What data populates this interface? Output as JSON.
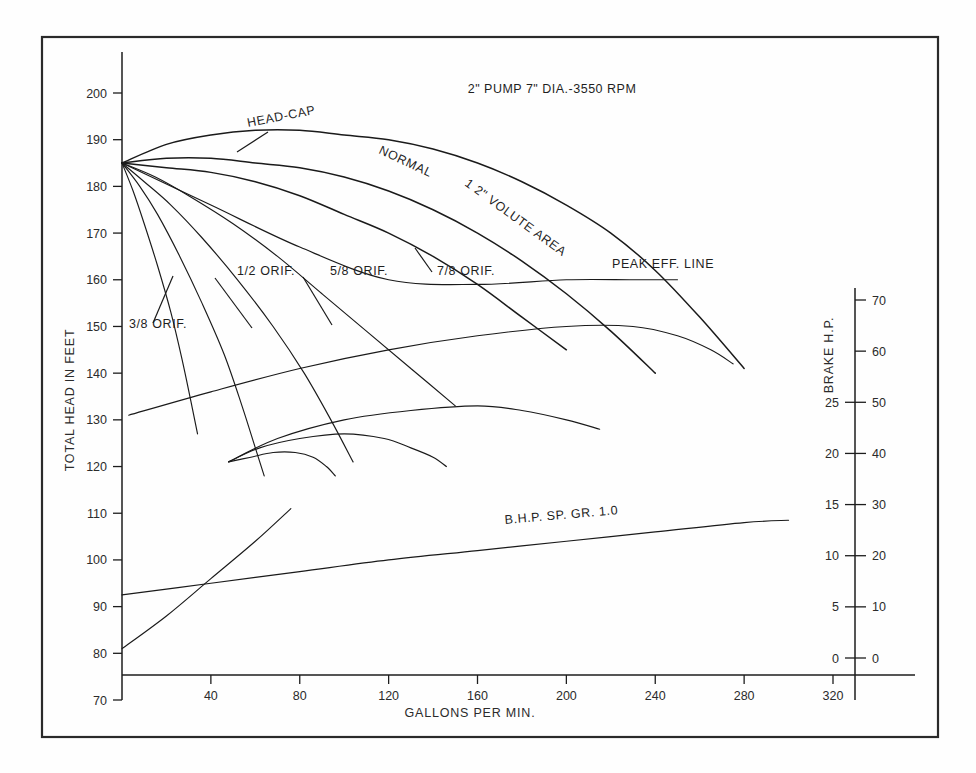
{
  "chart_data": {
    "type": "line",
    "title": "2\" PUMP 7\" DIA.-3550 RPM",
    "xlabel": "GALLONS PER MIN.",
    "ylabel": "TOTAL HEAD IN FEET",
    "y2label": "BRAKE H.P.",
    "xlim": [
      0,
      340
    ],
    "ylim": [
      70,
      205
    ],
    "grid": false,
    "legend_position": "inline-annotations",
    "xticks": [
      40,
      80,
      120,
      160,
      200,
      240,
      280,
      320
    ],
    "yticks": [
      70,
      80,
      90,
      100,
      110,
      120,
      130,
      140,
      150,
      160,
      170,
      180,
      190,
      200
    ],
    "y2_ticks_outer": [
      0,
      10,
      20,
      30,
      40,
      50,
      60,
      70
    ],
    "y2_ticks_inner": [
      0,
      5,
      10,
      15,
      20,
      25
    ],
    "shutoff_head": 185,
    "annotations": [
      {
        "id": "head-cap",
        "label": "HEAD-CAP",
        "rotation": -11
      },
      {
        "id": "normal",
        "label": "NORMAL",
        "rotation": 25
      },
      {
        "id": "volute-area",
        "label": "1 2\" VOLUTE AREA",
        "rotation": 36
      },
      {
        "id": "peak-eff-line",
        "label": "PEAK EFF. LINE",
        "rotation": 0
      },
      {
        "id": "orif-38",
        "label": "3/8 ORIF.",
        "rotation": 0
      },
      {
        "id": "orif-12",
        "label": "1/2 ORIF.",
        "rotation": 0
      },
      {
        "id": "orif-58",
        "label": "5/8 ORIF.",
        "rotation": 0
      },
      {
        "id": "orif-78",
        "label": "7/8 ORIF.",
        "rotation": 0
      },
      {
        "id": "bhp-line",
        "label": "B.H.P. SP. GR. 1.0",
        "rotation": -5
      }
    ],
    "series": [
      {
        "name": "HEAD-CAP",
        "kind": "head-capacity",
        "points": [
          [
            0,
            185
          ],
          [
            20,
            189
          ],
          [
            40,
            191
          ],
          [
            60,
            192
          ],
          [
            80,
            192
          ],
          [
            100,
            191
          ],
          [
            120,
            190
          ],
          [
            140,
            188
          ],
          [
            160,
            185
          ],
          [
            180,
            181
          ],
          [
            200,
            176
          ],
          [
            220,
            170
          ],
          [
            240,
            162
          ],
          [
            260,
            152
          ],
          [
            280,
            141
          ]
        ]
      },
      {
        "name": "NORMAL",
        "kind": "head-capacity",
        "points": [
          [
            0,
            185
          ],
          [
            20,
            186
          ],
          [
            40,
            186
          ],
          [
            60,
            185
          ],
          [
            80,
            184
          ],
          [
            100,
            182
          ],
          [
            120,
            179
          ],
          [
            140,
            175
          ],
          [
            160,
            170
          ],
          [
            180,
            164
          ],
          [
            200,
            157
          ],
          [
            220,
            149
          ],
          [
            240,
            140
          ]
        ]
      },
      {
        "name": "1 2\" VOLUTE AREA",
        "kind": "head-capacity",
        "points": [
          [
            0,
            185
          ],
          [
            20,
            184
          ],
          [
            40,
            183
          ],
          [
            60,
            181
          ],
          [
            80,
            178
          ],
          [
            100,
            174
          ],
          [
            120,
            170
          ],
          [
            140,
            165
          ],
          [
            160,
            159
          ],
          [
            180,
            152
          ],
          [
            200,
            145
          ]
        ]
      },
      {
        "name": "7/8 ORIF.",
        "kind": "orifice",
        "points": [
          [
            0,
            185
          ],
          [
            15,
            182
          ],
          [
            30,
            178
          ],
          [
            50,
            172
          ],
          [
            70,
            165
          ],
          [
            90,
            157
          ],
          [
            110,
            149
          ],
          [
            130,
            141
          ],
          [
            150,
            133
          ]
        ]
      },
      {
        "name": "5/8 ORIF.",
        "kind": "orifice",
        "points": [
          [
            0,
            185
          ],
          [
            10,
            181
          ],
          [
            22,
            176
          ],
          [
            36,
            169
          ],
          [
            52,
            160
          ],
          [
            68,
            150
          ],
          [
            82,
            140
          ],
          [
            94,
            130
          ],
          [
            104,
            121
          ]
        ]
      },
      {
        "name": "1/2 ORIF.",
        "kind": "orifice",
        "points": [
          [
            0,
            185
          ],
          [
            8,
            180
          ],
          [
            16,
            174
          ],
          [
            26,
            165
          ],
          [
            36,
            155
          ],
          [
            46,
            144
          ],
          [
            54,
            133
          ],
          [
            60,
            124
          ],
          [
            64,
            118
          ]
        ]
      },
      {
        "name": "3/8 ORIF.",
        "kind": "orifice",
        "points": [
          [
            0,
            185
          ],
          [
            5,
            179
          ],
          [
            10,
            172
          ],
          [
            16,
            163
          ],
          [
            22,
            153
          ],
          [
            27,
            143
          ],
          [
            31,
            134
          ],
          [
            34,
            127
          ]
        ]
      },
      {
        "name": "PEAK EFF. LINE",
        "kind": "peak-efficiency",
        "points": [
          [
            0,
            185
          ],
          [
            40,
            176
          ],
          [
            80,
            167
          ],
          [
            120,
            160
          ],
          [
            160,
            159
          ],
          [
            200,
            160
          ],
          [
            230,
            160
          ],
          [
            250,
            160
          ]
        ]
      },
      {
        "name": "EFFICIENCY TOP",
        "kind": "efficiency",
        "points": [
          [
            3,
            131
          ],
          [
            40,
            136
          ],
          [
            80,
            141
          ],
          [
            120,
            145
          ],
          [
            160,
            148
          ],
          [
            200,
            150
          ],
          [
            230,
            150
          ],
          [
            250,
            148
          ],
          [
            265,
            145
          ],
          [
            275,
            142
          ]
        ]
      },
      {
        "name": "EFFICIENCY MID",
        "kind": "efficiency",
        "points": [
          [
            48,
            121
          ],
          [
            70,
            126
          ],
          [
            100,
            130
          ],
          [
            130,
            132
          ],
          [
            160,
            133
          ],
          [
            180,
            132
          ],
          [
            200,
            130
          ],
          [
            215,
            128
          ]
        ]
      },
      {
        "name": "EFFICIENCY LOW",
        "kind": "efficiency",
        "points": [
          [
            48,
            121
          ],
          [
            62,
            124
          ],
          [
            80,
            126
          ],
          [
            100,
            127
          ],
          [
            118,
            126
          ],
          [
            130,
            124
          ],
          [
            140,
            122
          ],
          [
            146,
            120
          ]
        ]
      },
      {
        "name": "EFFICIENCY SMALL",
        "kind": "efficiency",
        "points": [
          [
            48,
            121
          ],
          [
            58,
            122
          ],
          [
            68,
            123
          ],
          [
            78,
            123
          ],
          [
            86,
            122
          ],
          [
            92,
            120
          ],
          [
            96,
            118
          ]
        ]
      },
      {
        "name": "B.H.P. SP. GR. 1.0",
        "kind": "brake-horsepower",
        "points": [
          [
            0,
            92.5
          ],
          [
            40,
            95
          ],
          [
            80,
            97.5
          ],
          [
            120,
            100
          ],
          [
            160,
            102
          ],
          [
            200,
            104
          ],
          [
            240,
            106
          ],
          [
            280,
            108
          ],
          [
            300,
            108.5
          ]
        ]
      },
      {
        "name": "BHP RISE",
        "kind": "brake-horsepower-rise",
        "points": [
          [
            0,
            81
          ],
          [
            20,
            88
          ],
          [
            40,
            96
          ],
          [
            60,
            104
          ],
          [
            76,
            111
          ]
        ]
      }
    ]
  }
}
